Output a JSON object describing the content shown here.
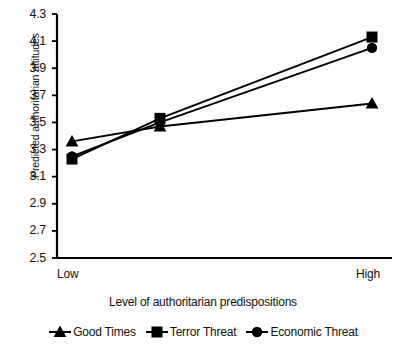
{
  "chart_data": {
    "type": "line",
    "title": "",
    "xlabel": "Level of authoritarian predispositions",
    "ylabel": "Predicted authoritarian attitudes",
    "categories": [
      "Low",
      "",
      "High"
    ],
    "x_tick_labels": [
      "Low",
      "High"
    ],
    "y_tick_labels": [
      "4.3",
      "4.1",
      "3.9",
      "3.7",
      "3.5",
      "3.3",
      "3.1",
      "2.9",
      "2.7",
      "2.5"
    ],
    "y_ticks": [
      4.3,
      4.1,
      3.9,
      3.7,
      3.5,
      3.3,
      3.1,
      2.9,
      2.7,
      2.5
    ],
    "ylim": [
      2.5,
      4.3
    ],
    "grid": false,
    "legend_position": "bottom",
    "series": [
      {
        "name": "Good Times",
        "marker": "triangle",
        "color": "#000000",
        "values": [
          3.36,
          3.47,
          3.64
        ]
      },
      {
        "name": "Terror Threat",
        "marker": "square",
        "color": "#000000",
        "values": [
          3.23,
          3.53,
          4.13
        ]
      },
      {
        "name": "Economic Threat",
        "marker": "circle",
        "color": "#000000",
        "values": [
          3.25,
          3.5,
          4.05
        ]
      }
    ]
  },
  "axes": {
    "y_title": "Predicted authoritarian attitudes",
    "x_title": "Level of authoritarian predispositions",
    "x_low_label": "Low",
    "x_high_label": "High"
  },
  "legend": {
    "items": [
      {
        "label": "Good Times",
        "marker": "triangle"
      },
      {
        "label": "Terror Threat",
        "marker": "square"
      },
      {
        "label": "Economic Threat",
        "marker": "circle"
      }
    ]
  },
  "colors": {
    "ink": "#000000",
    "text": "#111111",
    "background": "#ffffff"
  }
}
